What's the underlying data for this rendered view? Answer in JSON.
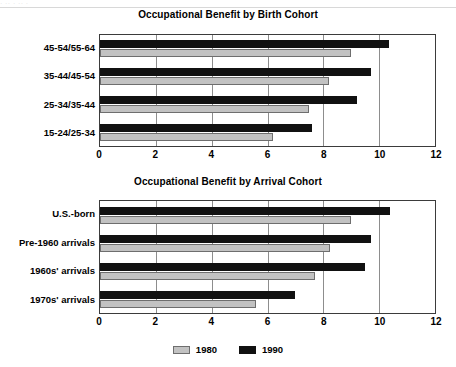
{
  "scan": {
    "top_partial_text": "· ·· ·  ·· ·"
  },
  "legend": {
    "items": [
      {
        "label": "1980",
        "color": "#c2c2c2",
        "name": "legend-item-1980"
      },
      {
        "label": "1990",
        "color": "#111111",
        "name": "legend-item-1990"
      }
    ]
  },
  "chart_data": [
    {
      "type": "bar",
      "orientation": "horizontal",
      "title": "Occupational Benefit by Birth Cohort",
      "xlabel": "",
      "ylabel": "",
      "xlim": [
        0,
        12
      ],
      "xticks": [
        0,
        2,
        4,
        6,
        8,
        10,
        12
      ],
      "xtick_labels": [
        "0",
        "2",
        "4",
        "6",
        "8",
        "10",
        "12"
      ],
      "grid": true,
      "legend_position": "bottom",
      "categories": [
        "45-54/55-64",
        "35-44/45-54",
        "25-34/35-44",
        "15-24/25-34"
      ],
      "series": [
        {
          "name": "1990",
          "color": "#111111",
          "values": [
            10.35,
            9.7,
            9.2,
            7.6
          ]
        },
        {
          "name": "1980",
          "color": "#c2c2c2",
          "values": [
            9.0,
            8.2,
            7.5,
            6.2
          ]
        }
      ]
    },
    {
      "type": "bar",
      "orientation": "horizontal",
      "title": "Occupational Benefit by Arrival Cohort",
      "xlabel": "",
      "ylabel": "",
      "xlim": [
        0,
        12
      ],
      "xticks": [
        0,
        2,
        4,
        6,
        8,
        10,
        12
      ],
      "xtick_labels": [
        "0",
        "2",
        "4",
        "6",
        "8",
        "10",
        "12"
      ],
      "grid": true,
      "legend_position": "bottom",
      "categories": [
        "U.S.-born",
        "Pre-1960 arrivals",
        "1960s' arrivals",
        "1970s' arrivals"
      ],
      "series": [
        {
          "name": "1990",
          "color": "#111111",
          "values": [
            10.4,
            9.7,
            9.5,
            7.0
          ]
        },
        {
          "name": "1980",
          "color": "#c2c2c2",
          "values": [
            9.0,
            8.25,
            7.7,
            5.6
          ]
        }
      ]
    }
  ]
}
